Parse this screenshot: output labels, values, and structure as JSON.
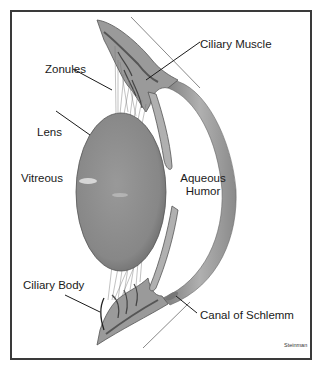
{
  "diagram": {
    "labels": {
      "zonules": "Zonules",
      "ciliary_muscle": "Ciliary Muscle",
      "lens": "Lens",
      "vitreous": "Vitreous",
      "aqueous_humor_line1": "Aqueous",
      "aqueous_humor_line2": "Humor",
      "ciliary_body": "Ciliary Body",
      "canal_of_schlemm": "Canal of Schlemm"
    },
    "credit": "Steinman",
    "colors": {
      "frame": "#3a3a3a",
      "lens_fill": "#8a8a8a",
      "cornea_fill": "#8c8c8c",
      "ciliary_fill": "#9a9a9a",
      "ciliary_dark": "#555555",
      "leader_line": "#1a1a1a",
      "background": "#ffffff"
    }
  }
}
